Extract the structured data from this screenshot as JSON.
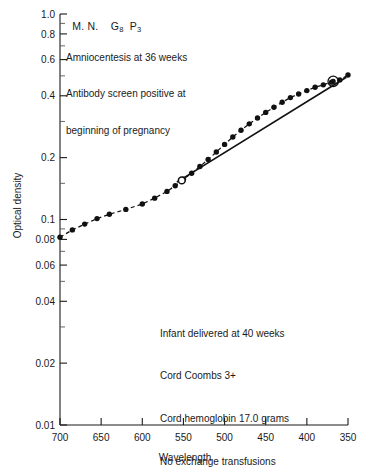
{
  "header": {
    "patient_initials": "M. N.",
    "gravida_label": "G",
    "gravida_value": "8",
    "para_label": "P",
    "para_value": "3"
  },
  "notes_top": [
    "Amniocentesis at 36 weeks",
    "Antibody screen positive at",
    "beginning of pregnancy"
  ],
  "notes_bottom": [
    "Infant delivered at 40 weeks",
    "Cord Coombs 3+",
    "Cord hemoglobin 17.0 grams",
    "No exchange transfusions"
  ],
  "chart_data": {
    "type": "scatter",
    "title": "",
    "xlabel": "Wavelength",
    "ylabel": "Optical density",
    "yscale": "log",
    "xscale": "linear",
    "xlim": [
      700,
      350
    ],
    "ylim": [
      0.01,
      1.0
    ],
    "grid": false,
    "legend": "none",
    "x_ticks": [
      700,
      650,
      600,
      550,
      500,
      450,
      400,
      350
    ],
    "x_tick_labels": [
      "700",
      "650",
      "600",
      "550",
      "500",
      "450",
      "400",
      "350"
    ],
    "y_ticks": [
      1.0,
      0.8,
      0.6,
      0.4,
      0.2,
      0.1,
      0.08,
      0.06,
      0.04,
      0.02,
      0.01
    ],
    "y_tick_labels": [
      "1.0",
      "0.8",
      "0.6",
      "0.4",
      "0.2",
      "0.1",
      "0.08",
      "0.06",
      "0.04",
      "0.02",
      "0.01"
    ],
    "y_minor_ticks": [
      0.9,
      0.7,
      0.5,
      0.3,
      0.15,
      0.09,
      0.07,
      0.05,
      0.03
    ],
    "series": [
      {
        "name": "Spectrophotometric scan",
        "style": "dashed-line-with-filled-circles",
        "points": [
          {
            "wavelength": 700,
            "optical_density": 0.082
          },
          {
            "wavelength": 685,
            "optical_density": 0.089
          },
          {
            "wavelength": 670,
            "optical_density": 0.095
          },
          {
            "wavelength": 655,
            "optical_density": 0.101
          },
          {
            "wavelength": 640,
            "optical_density": 0.106
          },
          {
            "wavelength": 620,
            "optical_density": 0.112
          },
          {
            "wavelength": 600,
            "optical_density": 0.119
          },
          {
            "wavelength": 585,
            "optical_density": 0.127
          },
          {
            "wavelength": 570,
            "optical_density": 0.137
          },
          {
            "wavelength": 560,
            "optical_density": 0.146
          },
          {
            "wavelength": 550,
            "optical_density": 0.157
          },
          {
            "wavelength": 540,
            "optical_density": 0.168
          },
          {
            "wavelength": 530,
            "optical_density": 0.181
          },
          {
            "wavelength": 520,
            "optical_density": 0.196
          },
          {
            "wavelength": 510,
            "optical_density": 0.213
          },
          {
            "wavelength": 500,
            "optical_density": 0.232
          },
          {
            "wavelength": 490,
            "optical_density": 0.252
          },
          {
            "wavelength": 480,
            "optical_density": 0.272
          },
          {
            "wavelength": 470,
            "optical_density": 0.292
          },
          {
            "wavelength": 460,
            "optical_density": 0.312
          },
          {
            "wavelength": 450,
            "optical_density": 0.332
          },
          {
            "wavelength": 440,
            "optical_density": 0.352
          },
          {
            "wavelength": 430,
            "optical_density": 0.372
          },
          {
            "wavelength": 420,
            "optical_density": 0.392
          },
          {
            "wavelength": 410,
            "optical_density": 0.408
          },
          {
            "wavelength": 400,
            "optical_density": 0.424
          },
          {
            "wavelength": 390,
            "optical_density": 0.44
          },
          {
            "wavelength": 380,
            "optical_density": 0.452
          },
          {
            "wavelength": 370,
            "optical_density": 0.466
          },
          {
            "wavelength": 360,
            "optical_density": 0.478
          },
          {
            "wavelength": 350,
            "optical_density": 0.505
          }
        ]
      },
      {
        "name": "Baseline",
        "style": "solid-straight-line",
        "endpoints": [
          {
            "wavelength": 558,
            "optical_density": 0.152
          },
          {
            "wavelength": 352,
            "optical_density": 0.492
          }
        ]
      }
    ],
    "markers": [
      {
        "label": "open-circle",
        "wavelength": 552,
        "optical_density": 0.155
      },
      {
        "label": "circled-point",
        "wavelength": 368,
        "optical_density": 0.47
      }
    ]
  }
}
